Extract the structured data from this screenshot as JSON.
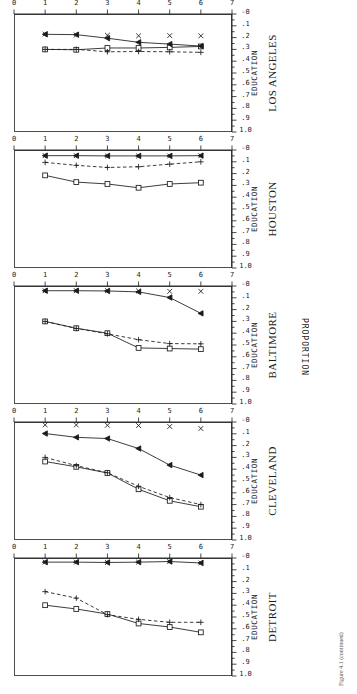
{
  "figure": {
    "y_axis_label": "PROPORTION",
    "x_axis_label": "EDUCATION",
    "caption": "Figure 4.1  (continued)"
  },
  "chart_data": {
    "type": "line",
    "title": "",
    "xlabel": "EDUCATION",
    "ylabel": "PROPORTION",
    "xlim": [
      0,
      7
    ],
    "ylim": [
      0,
      1.0
    ],
    "xticks": [
      "0",
      "1",
      "2",
      "3",
      "4",
      "5",
      "6",
      "7"
    ],
    "yticks": [
      "-0",
      ".1",
      ".2",
      ".3",
      ".4",
      ".5",
      ".6",
      ".7",
      ".8",
      ".9",
      "1.0"
    ],
    "grid": false,
    "legend_position": "none",
    "x": [
      1,
      2,
      3,
      4,
      5,
      6
    ],
    "panels": [
      {
        "name": "LOS ANGELES",
        "series": [
          {
            "name": "square-solid",
            "marker": "square",
            "line": "solid",
            "values": [
              0.3,
              0.303,
              0.288,
              0.288,
              0.283,
              0.275
            ]
          },
          {
            "name": "plus-dashed",
            "marker": "plus",
            "line": "dashed",
            "values": [
              0.3,
              0.3,
              0.32,
              0.318,
              0.32,
              0.325
            ]
          },
          {
            "name": "tri-solid",
            "marker": "triangle",
            "line": "solid",
            "values": [
              0.172,
              0.175,
              0.205,
              0.24,
              0.255,
              0.272
            ]
          },
          {
            "name": "x-dashed",
            "marker": "x",
            "line": "none",
            "values": [
              0.17,
              0.178,
              0.18,
              0.185,
              0.183,
              0.185
            ]
          }
        ]
      },
      {
        "name": "HOUSTON",
        "series": [
          {
            "name": "square-solid",
            "marker": "square",
            "line": "solid",
            "values": [
              0.215,
              0.272,
              0.288,
              0.32,
              0.288,
              0.277
            ]
          },
          {
            "name": "plus-dashed",
            "marker": "plus",
            "line": "dashed",
            "values": [
              0.105,
              0.13,
              0.148,
              0.142,
              0.12,
              0.1
            ]
          },
          {
            "name": "tri-solid",
            "marker": "triangle",
            "line": "solid",
            "values": [
              0.048,
              0.048,
              0.05,
              0.05,
              0.05,
              0.048
            ]
          },
          {
            "name": "x-dashed",
            "marker": "x",
            "line": "none",
            "values": [
              0.048,
              0.048,
              0.05,
              0.05,
              0.05,
              0.048
            ]
          }
        ]
      },
      {
        "name": "BALTIMORE",
        "series": [
          {
            "name": "square-solid",
            "marker": "square",
            "line": "solid",
            "values": [
              0.3,
              0.358,
              0.4,
              0.525,
              0.53,
              0.535
            ]
          },
          {
            "name": "plus-dashed",
            "marker": "plus",
            "line": "dashed",
            "values": [
              0.3,
              0.36,
              0.405,
              0.455,
              0.488,
              0.49
            ]
          },
          {
            "name": "tri-solid",
            "marker": "triangle",
            "line": "solid",
            "values": [
              0.04,
              0.04,
              0.042,
              0.05,
              0.098,
              0.232
            ]
          },
          {
            "name": "x-dashed",
            "marker": "x",
            "line": "none",
            "values": [
              0.04,
              0.04,
              0.04,
              0.042,
              0.045,
              0.045
            ]
          }
        ]
      },
      {
        "name": "CLEVELAND",
        "series": [
          {
            "name": "square-solid",
            "marker": "square",
            "line": "solid",
            "values": [
              0.335,
              0.38,
              0.432,
              0.57,
              0.668,
              0.718
            ]
          },
          {
            "name": "plus-dashed",
            "marker": "plus",
            "line": "dashed",
            "values": [
              0.3,
              0.37,
              0.43,
              0.545,
              0.64,
              0.7
            ]
          },
          {
            "name": "tri-solid",
            "marker": "triangle",
            "line": "solid",
            "values": [
              0.098,
              0.13,
              0.14,
              0.225,
              0.365,
              0.45
            ]
          },
          {
            "name": "x-dashed",
            "marker": "x",
            "line": "none",
            "values": [
              0.025,
              0.025,
              0.028,
              0.03,
              0.038,
              0.055
            ]
          }
        ]
      },
      {
        "name": "DETROIT",
        "series": [
          {
            "name": "square-solid",
            "marker": "square",
            "line": "solid",
            "values": [
              0.4,
              0.432,
              0.475,
              0.555,
              0.585,
              0.63
            ]
          },
          {
            "name": "plus-dashed",
            "marker": "plus",
            "line": "dashed",
            "values": [
              0.285,
              0.34,
              0.48,
              0.52,
              0.545,
              0.545
            ]
          },
          {
            "name": "tri-solid",
            "marker": "triangle",
            "line": "solid",
            "values": [
              0.035,
              0.035,
              0.038,
              0.035,
              0.03,
              0.042
            ]
          },
          {
            "name": "x-dashed",
            "marker": "x",
            "line": "none",
            "values": [
              0.035,
              0.035,
              0.038,
              0.035,
              0.03,
              0.042
            ]
          }
        ]
      }
    ]
  }
}
